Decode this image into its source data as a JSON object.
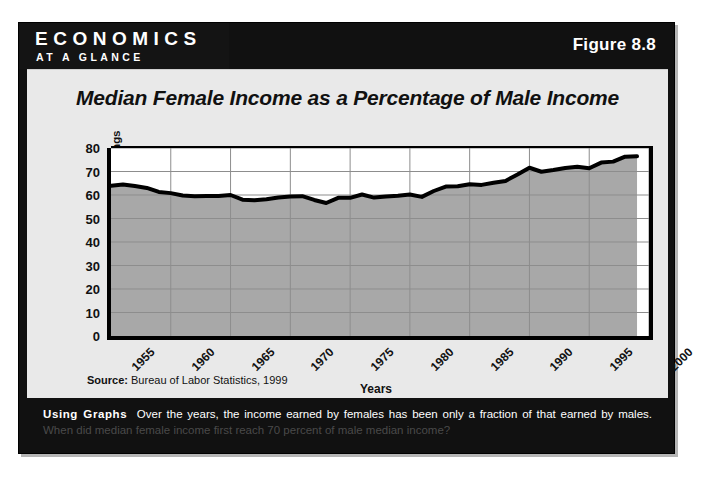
{
  "banner": {
    "title": "ECONOMICS",
    "subtitle": "AT A GLANCE"
  },
  "figure_number": "Figure 8.8",
  "source": {
    "label": "Source:",
    "text": " Bureau of Labor Statistics, 1999"
  },
  "caption": {
    "lead": "Using Graphs",
    "body": "Over the years, the income earned by females has been only a fraction of that earned by males.",
    "question": "When did median female income first reach 70 percent of male median income?"
  },
  "chart_data": {
    "type": "line",
    "title": "Median Female Income as a Percentage of Male Income",
    "xlabel": "Years",
    "ylabel": "Female/Male Earnings Ratio",
    "xlim": [
      1955,
      2000
    ],
    "ylim": [
      0,
      80
    ],
    "yticks": [
      0,
      10,
      20,
      30,
      40,
      50,
      60,
      70,
      80
    ],
    "xticks": [
      1955,
      1960,
      1965,
      1970,
      1975,
      1980,
      1985,
      1990,
      1995,
      2000
    ],
    "grid": true,
    "legend": "none",
    "fill": "area",
    "series": [
      {
        "name": "Female/Male Earnings Ratio",
        "x": [
          1955,
          1956,
          1957,
          1958,
          1959,
          1960,
          1961,
          1962,
          1963,
          1964,
          1965,
          1966,
          1967,
          1968,
          1969,
          1970,
          1971,
          1972,
          1973,
          1974,
          1975,
          1976,
          1977,
          1978,
          1979,
          1980,
          1981,
          1982,
          1983,
          1984,
          1985,
          1986,
          1987,
          1988,
          1989,
          1990,
          1991,
          1992,
          1993,
          1994,
          1995,
          1996,
          1997,
          1998,
          1999
        ],
        "values": [
          63.9,
          64.5,
          63.8,
          63.0,
          61.3,
          60.8,
          59.8,
          59.5,
          59.6,
          59.6,
          60.0,
          58.0,
          57.8,
          58.2,
          58.9,
          59.4,
          59.5,
          57.9,
          56.6,
          58.8,
          58.8,
          60.2,
          58.9,
          59.4,
          59.7,
          60.2,
          59.2,
          61.7,
          63.6,
          63.7,
          64.6,
          64.3,
          65.2,
          66.0,
          68.7,
          71.6,
          69.9,
          70.6,
          71.5,
          72.0,
          71.4,
          73.8,
          74.2,
          76.3,
          76.5
        ]
      }
    ]
  }
}
